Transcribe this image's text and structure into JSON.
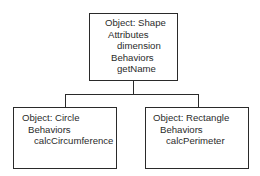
{
  "diagram": {
    "parent": {
      "object_label": "Object: Shape",
      "attributes_label": "Attributes",
      "attributes": [
        "dimension"
      ],
      "behaviors_label": "Behaviors",
      "behaviors": [
        "getName"
      ]
    },
    "children": [
      {
        "object_label": "Object: Circle",
        "behaviors_label": "Behaviors",
        "behaviors": [
          "calcCircumference"
        ]
      },
      {
        "object_label": "Object: Rectangle",
        "behaviors_label": "Behaviors",
        "behaviors": [
          "calcPerimeter"
        ]
      }
    ]
  }
}
